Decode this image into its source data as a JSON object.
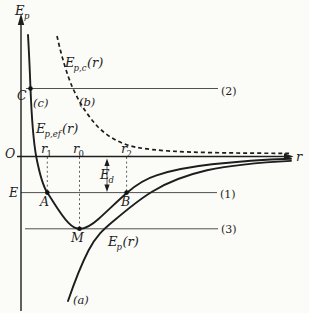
{
  "colors": {
    "background": "#fbfbf8",
    "ink": "#1d1d1d",
    "thin_line": "#3c3c3c"
  },
  "axes": {
    "y_label_main": "E",
    "y_label_sub": "p",
    "x_label": "r",
    "origin_label": "O"
  },
  "levels": {
    "l1_label": "(1)",
    "l2_label": "(2)",
    "l3_label": "(3)"
  },
  "points": {
    "a": "A",
    "b": "B",
    "c": "C",
    "m": "M"
  },
  "energy": {
    "level_label": "E",
    "depth_main": "E",
    "depth_sub": "d"
  },
  "radii": {
    "r1_main": "r",
    "r1_sub": "1",
    "r0_main": "r",
    "r0_sub": "0",
    "r2_main": "r",
    "r2_sub": "2"
  },
  "curves": {
    "ep": {
      "main": "E",
      "sub": "p",
      "paren": "(r)",
      "tag": "(a)"
    },
    "epc": {
      "main": "E",
      "sub": "p,c",
      "paren": "(r)",
      "tag": "(b)"
    },
    "epef": {
      "main": "E",
      "sub": "p,ef",
      "paren": "(r)",
      "tag": "(c)"
    }
  }
}
